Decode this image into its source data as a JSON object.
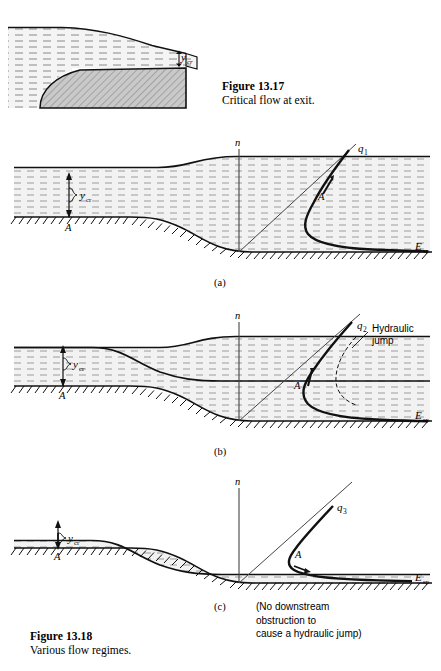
{
  "page": {
    "width": 441,
    "height": 671,
    "background": "#ffffff",
    "ink": "#000000",
    "water_fill": "#efefef",
    "hatch_fill": "#bdbdbd"
  },
  "figure_13_17": {
    "caption_title": "Figure 13.17",
    "caption_text": "Critical flow at exit.",
    "labels": {
      "y_cr": "y",
      "y_cr_sub": "cr"
    },
    "description": "Reservoir with free overfall; critical depth at the exit lip."
  },
  "figure_13_18": {
    "caption_title": "Figure 13.18",
    "caption_text": "Various flow regimes.",
    "note": "(No downstream\nobstruction to\ncause a hydraulic jump)",
    "panels": [
      {
        "id": "a",
        "sublabel": "(a)",
        "axis_vertical": "n",
        "axis_horizontal": "E",
        "axis_horizontal_sub": "sp",
        "curve_label": "q",
        "curve_label_sub": "1",
        "point_label": "A",
        "depth_label": "y",
        "depth_label_sub": "cr",
        "datum_label": "A",
        "regime": "subcritical upstream, subcritical downstream over a bump"
      },
      {
        "id": "b",
        "sublabel": "(b)",
        "axis_vertical": "n",
        "axis_horizontal": "E",
        "axis_horizontal_sub": "sp",
        "curve_label": "q",
        "curve_label_sub": "2",
        "point_label": "A",
        "depth_label": "y",
        "depth_label_sub": "cr",
        "datum_label": "A",
        "annotation": "Hydraulic\njump",
        "annotation_line1": "Hydraulic",
        "annotation_line2": "jump",
        "regime": "supercritical downstream terminated by a hydraulic jump"
      },
      {
        "id": "c",
        "sublabel": "(c)",
        "axis_vertical": "n",
        "axis_horizontal": "E",
        "axis_horizontal_sub": "sp",
        "curve_label": "q",
        "curve_label_sub": "3",
        "point_label": "A",
        "depth_label": "y",
        "depth_label_sub": "cr",
        "datum_label": "A",
        "regime": "supercritical downstream, no jump"
      }
    ]
  }
}
